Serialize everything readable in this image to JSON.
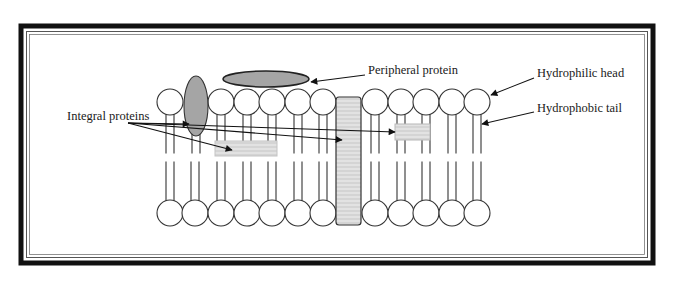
{
  "diagram": {
    "labels": {
      "peripheral": "Peripheral protein",
      "integral": "Integral proteins",
      "head": "Hydrophilic head",
      "tail": "Hydrophobic tail"
    },
    "colors": {
      "border": "#111111",
      "protein_fill": "#a9a9a9",
      "hatch_fill": "#d6d6d6",
      "hatch_line": "#f2f2f2",
      "line": "#333333"
    },
    "bilayer": {
      "top_row_y": 102,
      "bottom_row_y": 213,
      "head_radius": 13,
      "top_heads_x": [
        170,
        221,
        247,
        272,
        298,
        323,
        375,
        401,
        426,
        452,
        477
      ],
      "bottom_heads_x": [
        170,
        195,
        221,
        247,
        272,
        298,
        323,
        375,
        401,
        426,
        452,
        477
      ]
    },
    "proteins": [
      {
        "name": "peripheral-protein",
        "shape": "ellipse",
        "cx": 266,
        "cy": 79,
        "rx": 43,
        "ry": 8
      },
      {
        "name": "integral-protein-ellipse",
        "shape": "ellipse",
        "cx": 196,
        "cy": 106,
        "rx": 12,
        "ry": 30
      },
      {
        "name": "integral-protein-transmembrane",
        "shape": "rect",
        "x": 336,
        "y": 97,
        "w": 25,
        "h": 128
      },
      {
        "name": "integral-protein-embedded-left",
        "shape": "rect",
        "x": 215,
        "y": 141,
        "w": 62,
        "h": 15
      },
      {
        "name": "integral-protein-embedded-right",
        "shape": "rect",
        "x": 395,
        "y": 124,
        "w": 35,
        "h": 16
      }
    ]
  }
}
